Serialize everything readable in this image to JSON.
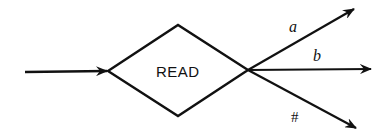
{
  "diagram": {
    "type": "flowchart-decision",
    "colors": {
      "stroke": "#111111",
      "background": "#ffffff"
    },
    "node": {
      "shape": "diamond",
      "label": "READ"
    },
    "input_arrow": {
      "label": ""
    },
    "branches": [
      {
        "label": "a",
        "direction": "up-right"
      },
      {
        "label": "b",
        "direction": "right"
      },
      {
        "label": "#",
        "direction": "down-right"
      }
    ]
  }
}
